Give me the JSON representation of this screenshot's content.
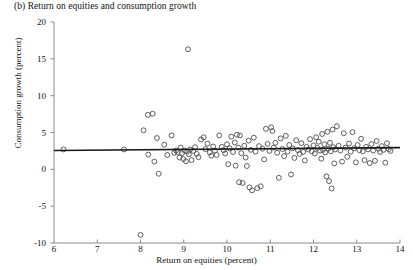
{
  "chart_data": {
    "type": "scatter",
    "title": "(b) Return on equities and consumption growth",
    "xlabel": "Return on equities (percent)",
    "ylabel": "Consumption growth (percent)",
    "xlim": [
      6,
      14
    ],
    "ylim": [
      -10,
      20
    ],
    "xticks": [
      6,
      7,
      8,
      9,
      10,
      11,
      12,
      13,
      14
    ],
    "yticks": [
      -10,
      -5,
      0,
      5,
      10,
      15,
      20
    ],
    "grid": false,
    "legend": null,
    "marker": "open-circle",
    "marker_color": "#555555",
    "fit_line": {
      "name": "regression line",
      "color": "#1a1a1a",
      "x_start": 6.0,
      "x_end": 14.0,
      "y_start": 2.55,
      "y_end": 2.95
    },
    "points": [
      [
        6.22,
        2.7
      ],
      [
        7.62,
        2.7
      ],
      [
        8.0,
        -8.9
      ],
      [
        8.07,
        5.3
      ],
      [
        8.17,
        7.4
      ],
      [
        8.18,
        2.0
      ],
      [
        8.28,
        7.55
      ],
      [
        8.32,
        1.05
      ],
      [
        8.38,
        4.25
      ],
      [
        8.42,
        -0.6
      ],
      [
        8.55,
        3.35
      ],
      [
        8.62,
        1.95
      ],
      [
        8.72,
        4.6
      ],
      [
        8.78,
        2.25
      ],
      [
        8.82,
        2.55
      ],
      [
        8.86,
        2.35
      ],
      [
        8.9,
        1.6
      ],
      [
        8.93,
        2.95
      ],
      [
        8.96,
        2.2
      ],
      [
        8.99,
        1.4
      ],
      [
        9.02,
        2.55
      ],
      [
        9.05,
        1.1
      ],
      [
        9.08,
        2.4
      ],
      [
        9.1,
        16.3
      ],
      [
        9.12,
        2.05
      ],
      [
        9.15,
        2.7
      ],
      [
        9.18,
        1.25
      ],
      [
        9.22,
        2.5
      ],
      [
        9.26,
        3.0
      ],
      [
        9.3,
        2.1
      ],
      [
        9.34,
        1.65
      ],
      [
        9.4,
        4.05
      ],
      [
        9.46,
        4.35
      ],
      [
        9.5,
        2.75
      ],
      [
        9.55,
        3.5
      ],
      [
        9.6,
        2.3
      ],
      [
        9.64,
        1.85
      ],
      [
        9.68,
        3.1
      ],
      [
        9.72,
        2.55
      ],
      [
        9.76,
        1.95
      ],
      [
        9.82,
        4.6
      ],
      [
        9.88,
        3.05
      ],
      [
        9.92,
        2.6
      ],
      [
        9.96,
        2.15
      ],
      [
        10.0,
        3.4
      ],
      [
        10.03,
        0.7
      ],
      [
        10.06,
        2.85
      ],
      [
        10.1,
        4.45
      ],
      [
        10.14,
        2.35
      ],
      [
        10.18,
        3.65
      ],
      [
        10.2,
        0.5
      ],
      [
        10.23,
        4.7
      ],
      [
        10.26,
        2.95
      ],
      [
        10.28,
        -1.75
      ],
      [
        10.3,
        4.6
      ],
      [
        10.33,
        2.2
      ],
      [
        10.36,
        -1.85
      ],
      [
        10.4,
        3.2
      ],
      [
        10.43,
        1.6
      ],
      [
        10.46,
        0.45
      ],
      [
        10.5,
        3.9
      ],
      [
        10.52,
        -2.45
      ],
      [
        10.55,
        2.65
      ],
      [
        10.58,
        -2.85
      ],
      [
        10.62,
        4.3
      ],
      [
        10.66,
        2.4
      ],
      [
        10.7,
        -2.55
      ],
      [
        10.74,
        3.15
      ],
      [
        10.78,
        -2.3
      ],
      [
        10.82,
        2.8
      ],
      [
        10.86,
        1.35
      ],
      [
        10.9,
        5.5
      ],
      [
        10.94,
        3.45
      ],
      [
        10.98,
        2.5
      ],
      [
        11.02,
        5.7
      ],
      [
        11.05,
        5.2
      ],
      [
        11.08,
        2.95
      ],
      [
        11.12,
        3.6
      ],
      [
        11.16,
        2.25
      ],
      [
        11.2,
        -1.15
      ],
      [
        11.24,
        4.2
      ],
      [
        11.28,
        2.75
      ],
      [
        11.32,
        1.8
      ],
      [
        11.36,
        4.55
      ],
      [
        11.4,
        2.4
      ],
      [
        11.44,
        3.3
      ],
      [
        11.48,
        -0.7
      ],
      [
        11.52,
        2.85
      ],
      [
        11.56,
        1.55
      ],
      [
        11.6,
        3.95
      ],
      [
        11.64,
        2.6
      ],
      [
        11.68,
        2.1
      ],
      [
        11.72,
        3.55
      ],
      [
        11.76,
        2.35
      ],
      [
        11.8,
        1.2
      ],
      [
        11.84,
        3.05
      ],
      [
        11.88,
        2.7
      ],
      [
        11.92,
        4.1
      ],
      [
        11.96,
        2.45
      ],
      [
        12.0,
        3.25
      ],
      [
        12.03,
        2.15
      ],
      [
        12.06,
        4.35
      ],
      [
        12.09,
        2.9
      ],
      [
        12.12,
        3.75
      ],
      [
        12.15,
        2.55
      ],
      [
        12.18,
        1.45
      ],
      [
        12.2,
        4.8
      ],
      [
        12.22,
        2.65
      ],
      [
        12.25,
        3.4
      ],
      [
        12.27,
        2.3
      ],
      [
        12.3,
        -0.95
      ],
      [
        12.32,
        5.1
      ],
      [
        12.34,
        2.8
      ],
      [
        12.36,
        -1.6
      ],
      [
        12.38,
        3.6
      ],
      [
        12.4,
        2.45
      ],
      [
        12.42,
        -2.6
      ],
      [
        12.44,
        5.4
      ],
      [
        12.46,
        3.0
      ],
      [
        12.48,
        0.8
      ],
      [
        12.5,
        2.7
      ],
      [
        12.54,
        5.85
      ],
      [
        12.58,
        3.2
      ],
      [
        12.62,
        2.55
      ],
      [
        12.66,
        1.05
      ],
      [
        12.7,
        4.9
      ],
      [
        12.74,
        2.95
      ],
      [
        12.78,
        1.7
      ],
      [
        12.82,
        3.5
      ],
      [
        12.86,
        2.4
      ],
      [
        12.9,
        5.05
      ],
      [
        12.94,
        2.85
      ],
      [
        12.98,
        0.95
      ],
      [
        13.02,
        3.3
      ],
      [
        13.06,
        2.6
      ],
      [
        13.1,
        4.15
      ],
      [
        13.14,
        2.45
      ],
      [
        13.18,
        1.25
      ],
      [
        13.22,
        3.05
      ],
      [
        13.26,
        2.7
      ],
      [
        13.3,
        0.85
      ],
      [
        13.34,
        3.45
      ],
      [
        13.38,
        2.55
      ],
      [
        13.42,
        1.15
      ],
      [
        13.46,
        3.85
      ],
      [
        13.5,
        2.8
      ],
      [
        13.54,
        2.35
      ],
      [
        13.58,
        3.15
      ],
      [
        13.62,
        2.65
      ],
      [
        13.66,
        0.9
      ],
      [
        13.7,
        3.55
      ],
      [
        13.74,
        2.75
      ],
      [
        13.78,
        2.5
      ]
    ]
  }
}
